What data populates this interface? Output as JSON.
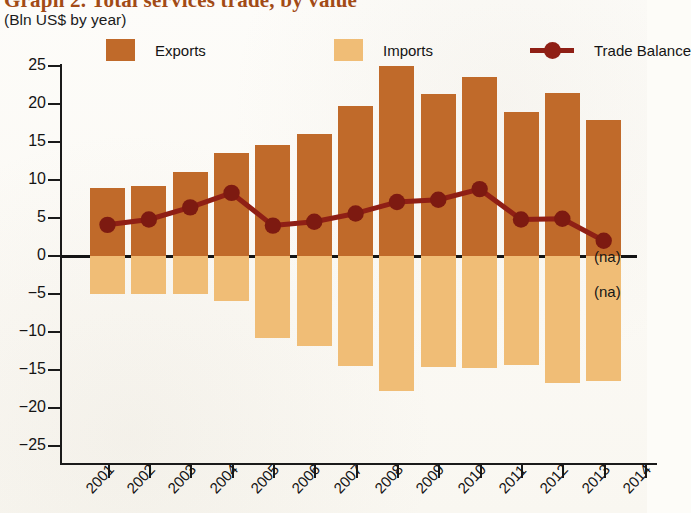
{
  "header": {
    "title": "Graph 2. Total services trade, by value",
    "subtitle": "(Bln US$ by year)"
  },
  "legend": {
    "items": [
      {
        "label": "Exports",
        "type": "swatch",
        "color": "#c06a2a"
      },
      {
        "label": "Imports",
        "type": "swatch",
        "color": "#f0bd76"
      },
      {
        "label": "Trade Balance",
        "type": "line",
        "color": "#8f1f15"
      }
    ]
  },
  "annotations": [
    {
      "text": "(na)",
      "note": "exports 2014 not available"
    },
    {
      "text": "(na)",
      "note": "imports 2014 not available"
    }
  ],
  "chart_data": {
    "type": "bar",
    "title": "Graph 2. Total services trade, by value",
    "subtitle": "(Bln US$ by year)",
    "xlabel": "",
    "ylabel": "Bln US$",
    "ylim": [
      -25,
      25
    ],
    "ytick_labels": [
      "25",
      "20",
      "15",
      "10",
      "5",
      "0",
      "−5",
      "−10",
      "−15",
      "−20",
      "−25"
    ],
    "yticks": [
      25,
      20,
      15,
      10,
      5,
      0,
      -5,
      -10,
      -15,
      -20,
      -25
    ],
    "grid": false,
    "legend_position": "top",
    "categories": [
      "2001",
      "2002",
      "2003",
      "2004",
      "2005",
      "2006",
      "2007",
      "2008",
      "2009",
      "2010",
      "2011",
      "2012",
      "2013",
      "2014"
    ],
    "series": [
      {
        "name": "Exports",
        "type": "bar",
        "color": "#c06a2a",
        "values": [
          9.0,
          9.2,
          11.0,
          13.5,
          14.6,
          16.0,
          19.7,
          25.0,
          21.3,
          23.6,
          18.9,
          21.5,
          17.9,
          null
        ]
      },
      {
        "name": "Imports",
        "type": "bar",
        "color": "#f0bd76",
        "values": [
          -5.0,
          -5.0,
          -5.0,
          -5.9,
          -10.8,
          -11.9,
          -14.5,
          -17.8,
          -14.6,
          -14.8,
          -14.3,
          -16.7,
          -16.5,
          null
        ]
      },
      {
        "name": "Trade Balance",
        "type": "line",
        "color": "#8f1f15",
        "values": [
          4.1,
          4.8,
          6.4,
          8.3,
          4.0,
          4.5,
          5.6,
          7.1,
          7.4,
          8.8,
          4.8,
          4.9,
          2.0,
          null
        ]
      }
    ]
  }
}
